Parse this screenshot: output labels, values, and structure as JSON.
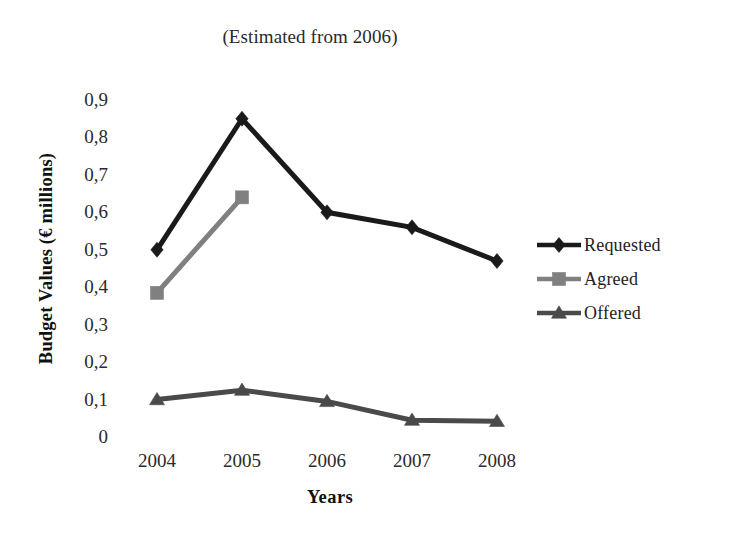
{
  "chart_data": {
    "type": "line",
    "title": "(Estimated from 2006)",
    "xlabel": "Years",
    "ylabel": "Budget Values (€ millions)",
    "categories": [
      "2004",
      "2005",
      "2006",
      "2007",
      "2008"
    ],
    "ylim": [
      0,
      0.9
    ],
    "ytick_labels": [
      "0,9",
      "0,8",
      "0,7",
      "0,6",
      "0,5",
      "0,4",
      "0,3",
      "0,2",
      "0,1",
      "0"
    ],
    "ytick_values": [
      0.9,
      0.8,
      0.7,
      0.6,
      0.5,
      0.4,
      0.3,
      0.2,
      0.1,
      0
    ],
    "grid": false,
    "axis_lines": false,
    "legend_position": "right",
    "series": [
      {
        "name": "Requested",
        "marker": "diamond",
        "color": "#1a1a1a",
        "values": [
          0.5,
          0.85,
          0.6,
          0.56,
          0.47
        ]
      },
      {
        "name": "Agreed",
        "marker": "square",
        "color": "#808080",
        "values": [
          0.385,
          0.64,
          null,
          null,
          null
        ]
      },
      {
        "name": "Offered",
        "marker": "triangle",
        "color": "#4a4a4a",
        "values": [
          0.1,
          0.125,
          0.095,
          0.045,
          0.042
        ]
      }
    ]
  }
}
